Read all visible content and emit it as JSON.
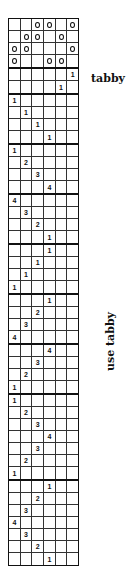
{
  "labels": {
    "tabby": "tabby",
    "use_tabby": "use tabby"
  },
  "grid": {
    "columns": 6,
    "threading": [
      [
        "",
        "",
        "o",
        "o",
        "",
        "o"
      ],
      [
        "",
        "o",
        "o",
        "",
        "o",
        ""
      ],
      [
        "o",
        "o",
        "",
        "",
        "",
        "o"
      ],
      [
        "o",
        "",
        "",
        "o",
        "o",
        ""
      ]
    ],
    "tabby": [
      [
        "",
        "",
        "",
        "",
        "",
        "1"
      ],
      [
        "",
        "",
        "",
        "",
        "1",
        ""
      ]
    ],
    "treadling_blocks": [
      [
        [
          "1",
          "",
          "",
          "",
          "",
          ""
        ],
        [
          "",
          "1",
          "",
          "",
          "",
          ""
        ],
        [
          "",
          "",
          "1",
          "",
          "",
          ""
        ],
        [
          "",
          "",
          "",
          "1",
          "",
          ""
        ]
      ],
      [
        [
          "1",
          "",
          "",
          "",
          "",
          ""
        ],
        [
          "",
          "2",
          "",
          "",
          "",
          ""
        ],
        [
          "",
          "",
          "3",
          "",
          "",
          ""
        ],
        [
          "",
          "",
          "",
          "4",
          "",
          ""
        ]
      ],
      [
        [
          "4",
          "",
          "",
          "",
          "",
          ""
        ],
        [
          "",
          "3",
          "",
          "",
          "",
          ""
        ],
        [
          "",
          "",
          "2",
          "",
          "",
          ""
        ],
        [
          "",
          "",
          "",
          "1",
          "",
          ""
        ]
      ],
      [
        [
          "",
          "",
          "",
          "1",
          "",
          ""
        ],
        [
          "",
          "",
          "1",
          "",
          "",
          ""
        ],
        [
          "",
          "1",
          "",
          "",
          "",
          ""
        ],
        [
          "1",
          "",
          "",
          "",
          "",
          ""
        ]
      ],
      [
        [
          "",
          "",
          "",
          "1",
          "",
          ""
        ],
        [
          "",
          "",
          "2",
          "",
          "",
          ""
        ],
        [
          "",
          "3",
          "",
          "",
          "",
          ""
        ],
        [
          "4",
          "",
          "",
          "",
          "",
          ""
        ]
      ],
      [
        [
          "",
          "",
          "",
          "4",
          "",
          ""
        ],
        [
          "",
          "",
          "3",
          "",
          "",
          ""
        ],
        [
          "",
          "2",
          "",
          "",
          "",
          ""
        ],
        [
          "1",
          "",
          "",
          "",
          "",
          ""
        ]
      ],
      [
        [
          "1",
          "",
          "",
          "",
          "",
          ""
        ],
        [
          "",
          "2",
          "",
          "",
          "",
          ""
        ],
        [
          "",
          "",
          "3",
          "",
          "",
          ""
        ],
        [
          "",
          "",
          "",
          "4",
          "",
          ""
        ],
        [
          "",
          "",
          "3",
          "",
          "",
          ""
        ],
        [
          "",
          "2",
          "",
          "",
          "",
          ""
        ],
        [
          "1",
          "",
          "",
          "",
          "",
          ""
        ]
      ],
      [
        [
          "",
          "",
          "",
          "1",
          "",
          ""
        ],
        [
          "",
          "",
          "2",
          "",
          "",
          ""
        ],
        [
          "",
          "3",
          "",
          "",
          "",
          ""
        ],
        [
          "4",
          "",
          "",
          "",
          "",
          ""
        ],
        [
          "",
          "3",
          "",
          "",
          "",
          ""
        ],
        [
          "",
          "",
          "2",
          "",
          "",
          ""
        ],
        [
          "",
          "",
          "",
          "1",
          "",
          ""
        ]
      ]
    ]
  }
}
